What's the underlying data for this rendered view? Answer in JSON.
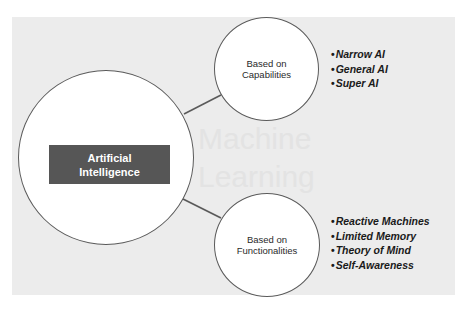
{
  "diagram": {
    "root": {
      "label_line1": "Artificial",
      "label_line2": "Intelligence"
    },
    "branches": [
      {
        "label_line1": "Based on",
        "label_line2": "Capabilities",
        "items": [
          "Narrow AI",
          "General AI",
          "Super AI"
        ]
      },
      {
        "label_line1": "Based on",
        "label_line2": "Functionalities",
        "items": [
          "Reactive Machines",
          "Limited Memory",
          "Theory of Mind",
          "Self-Awareness"
        ]
      }
    ],
    "bullet_char": "•",
    "background_ghost_text": [
      "Machine",
      "Learning"
    ],
    "colors": {
      "panel_background": "#ececec",
      "root_box": "#565656",
      "circle_stroke": "#5a5a5a",
      "circle_fill": "#ffffff"
    }
  }
}
